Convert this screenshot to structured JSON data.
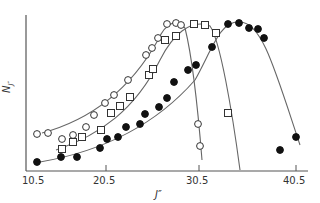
{
  "chart_data": {
    "type": "scatter",
    "title": "",
    "xlabel": "J″",
    "ylabel": "N_J″",
    "xlim": [
      10.5,
      40.5
    ],
    "x_ticks": [
      "10.5",
      "20.5",
      "30.5",
      "40.5"
    ],
    "y_ticks": [],
    "grid": false,
    "legend": "none",
    "series": [
      {
        "name": "open circles",
        "marker": "open-circle",
        "points_px": [
          [
            37,
            134
          ],
          [
            48,
            133
          ],
          [
            62,
            139
          ],
          [
            73,
            135
          ],
          [
            86,
            127
          ],
          [
            94,
            115
          ],
          [
            105,
            103
          ],
          [
            114,
            95
          ],
          [
            128,
            80
          ],
          [
            146,
            55
          ],
          [
            152,
            48
          ],
          [
            158,
            38
          ],
          [
            167,
            24
          ],
          [
            176,
            23
          ],
          [
            181,
            25
          ],
          [
            198,
            124
          ],
          [
            200,
            146
          ]
        ],
        "x": [
          11.7,
          12.9,
          14.4,
          15.6,
          16.9,
          17.8,
          19.9,
          21.4,
          22.2,
          24.2,
          24.8,
          25.5,
          26.5,
          27.4,
          28.0,
          29.8,
          30.0
        ],
        "y": [
          0.25,
          0.25,
          0.21,
          0.24,
          0.29,
          0.37,
          0.45,
          0.5,
          0.6,
          0.77,
          0.81,
          0.88,
          0.97,
          0.98,
          0.97,
          0.31,
          0.17
        ]
      },
      {
        "name": "open squares",
        "marker": "open-square",
        "points_px": [
          [
            62,
            149
          ],
          [
            73,
            142
          ],
          [
            82,
            137
          ],
          [
            101,
            130
          ],
          [
            111,
            113
          ],
          [
            120,
            106
          ],
          [
            130,
            97
          ],
          [
            149,
            75
          ],
          [
            153,
            69
          ],
          [
            165,
            40
          ],
          [
            176,
            36
          ],
          [
            194,
            24
          ],
          [
            205,
            25
          ],
          [
            216,
            33
          ],
          [
            228,
            113
          ]
        ],
        "x": [
          14.4,
          15.6,
          16.6,
          18.6,
          21.0,
          22.0,
          23.1,
          25.0,
          25.5,
          26.8,
          27.9,
          29.8,
          31.0,
          32.2,
          33.5
        ],
        "y": [
          0.15,
          0.19,
          0.23,
          0.27,
          0.38,
          0.43,
          0.49,
          0.64,
          0.68,
          0.87,
          0.9,
          0.98,
          0.97,
          0.91,
          0.38
        ]
      },
      {
        "name": "filled circles",
        "marker": "filled-circle",
        "points_px": [
          [
            37,
            162
          ],
          [
            61,
            157
          ],
          [
            77,
            157
          ],
          [
            100,
            148
          ],
          [
            107,
            139
          ],
          [
            118,
            137
          ],
          [
            126,
            127
          ],
          [
            140,
            124
          ],
          [
            145,
            114
          ],
          [
            159,
            107
          ],
          [
            167,
            98
          ],
          [
            174,
            82
          ],
          [
            188,
            70
          ],
          [
            196,
            65
          ],
          [
            212,
            47
          ],
          [
            228,
            24
          ],
          [
            239,
            23
          ],
          [
            249,
            28
          ],
          [
            258,
            29
          ],
          [
            264,
            38
          ],
          [
            280,
            150
          ],
          [
            296,
            137
          ]
        ],
        "x": [
          11.7,
          14.2,
          15.9,
          18.4,
          21.1,
          22.3,
          23.1,
          24.6,
          25.2,
          26.6,
          27.5,
          28.2,
          29.7,
          30.6,
          32.3,
          34.0,
          35.2,
          36.2,
          37.2,
          37.8,
          39.5,
          40.5
        ],
        "y": [
          0.06,
          0.09,
          0.09,
          0.15,
          0.21,
          0.23,
          0.29,
          0.31,
          0.38,
          0.42,
          0.48,
          0.59,
          0.66,
          0.7,
          0.82,
          0.97,
          0.98,
          0.95,
          0.94,
          0.88,
          0.14,
          0.23
        ]
      }
    ],
    "fitted_curves": [
      {
        "series": "open circles",
        "path": "M 42 133 C 90 120, 130 90, 158 40 C 166 22, 178 18, 185 28 C 193 60, 198 110, 202 160"
      },
      {
        "series": "open squares",
        "path": "M 56 150 C 100 135, 135 110, 160 60 C 172 36, 190 18, 210 26 C 220 40, 232 110, 240 170"
      },
      {
        "series": "filled circles",
        "path": "M 40 162 C 110 150, 160 120, 195 80 C 212 50, 220 20, 240 22 C 262 22, 275 70, 300 145"
      }
    ]
  },
  "axes": {
    "x_tick_labels": [
      "10.5",
      "20.5",
      "30.5",
      "40.5"
    ],
    "x_title": "J″",
    "y_title": "N",
    "y_title_sub": "J″"
  }
}
